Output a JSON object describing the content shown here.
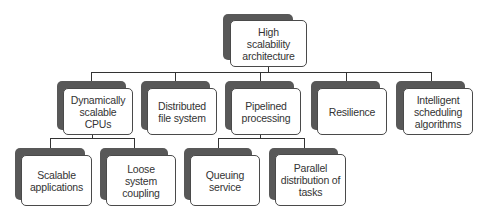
{
  "diagram": {
    "root": {
      "label": "High\nscalability\narchitecture"
    },
    "level1": [
      {
        "label": "Dynamically scalable CPUs"
      },
      {
        "label": "Distributed file system"
      },
      {
        "label": "Pipelined processing"
      },
      {
        "label": "Resilience"
      },
      {
        "label": "Intelligent scheduling algorithms"
      }
    ],
    "level2": [
      {
        "parent": "Dynamically scalable CPUs",
        "label": "Scalable applications"
      },
      {
        "parent": "Dynamically scalable CPUs",
        "label": "Loose system coupling"
      },
      {
        "parent": "Pipelined processing",
        "label": "Queuing service"
      },
      {
        "parent": "Pipelined processing",
        "label": "Parallel distribution of tasks"
      }
    ],
    "colors": {
      "shadow": "#585858",
      "border": "#4a4a4a",
      "text": "#333333",
      "line": "#333333"
    }
  }
}
